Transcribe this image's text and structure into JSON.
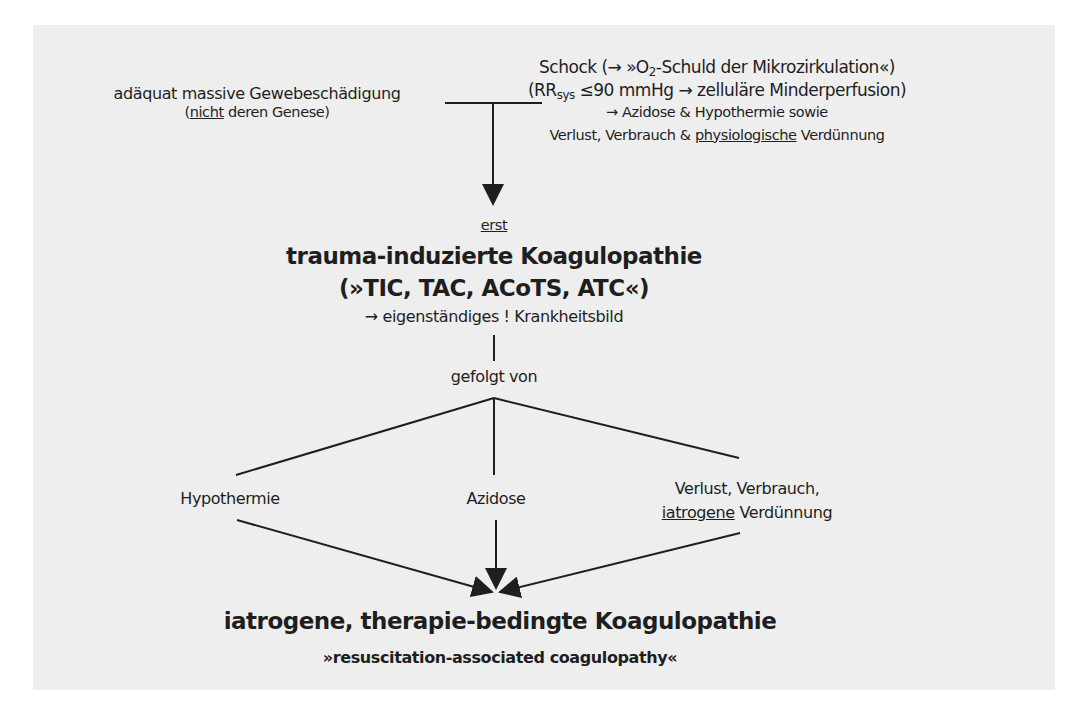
{
  "diagram": {
    "left_cause": {
      "line1": "adäquat massive Gewebeschädigung",
      "line2_open": "(",
      "line2_underlined": "nicht",
      "line2_rest": " deren Genese)"
    },
    "right_cause": {
      "line1_pre": "Schock (→ »O",
      "line1_sub": "2",
      "line1_post": "-Schuld der Mikrozirkulation«)",
      "line2_pre": "(RR",
      "line2_sub": "sys",
      "line2_post": " ≤90 mmHg → zelluläre Minderperfusion)",
      "line3": "→ Azidose & Hypothermie sowie",
      "line4_pre": "Verlust, Verbrauch & ",
      "line4_underlined": "physiologische",
      "line4_post": " Verdünnung"
    },
    "first_label": "erst",
    "tic": {
      "title": "trauma-induzierte Koagulopathie",
      "abbrev": "(»TIC, TAC, ACoTS, ATC«)",
      "note": "→ eigenständiges ! Krankheitsbild"
    },
    "followed_by": "gefolgt von",
    "factors": {
      "left": "Hypothermie",
      "center": "Azidose",
      "right_line1": "Verlust, Verbrauch,",
      "right_line2_underlined": "iatrogene",
      "right_line2_rest": " Verdünnung"
    },
    "result": {
      "title": "iatrogene, therapie-bedingte Koagulopathie",
      "subtitle": "»resuscitation-associated coagulopathy«"
    },
    "colors": {
      "panel_bg": "#eeeeee",
      "ink": "#1e1e1e"
    }
  }
}
